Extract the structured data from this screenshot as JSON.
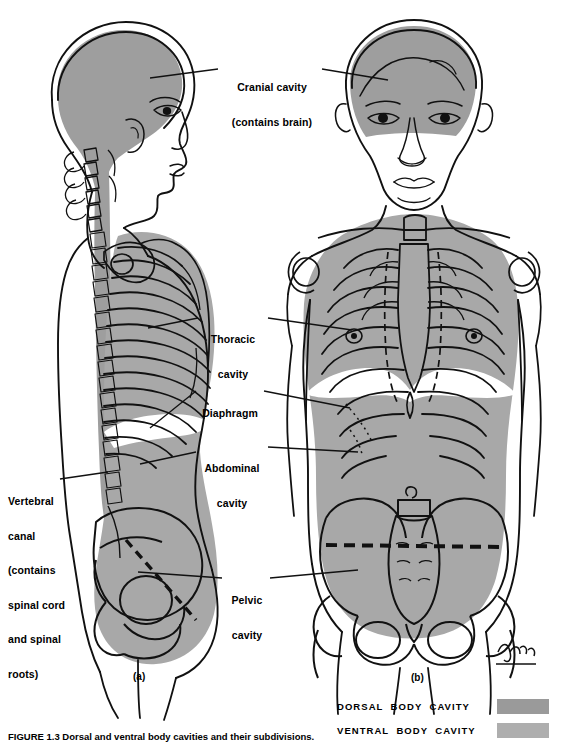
{
  "figure": {
    "caption": "FIGURE 1.3  Dorsal and ventral body cavities and their subdivisions.",
    "panel_a_label": "(a)",
    "panel_b_label": "(b)",
    "artist_signature": "Adam"
  },
  "colors": {
    "dorsal_cavity_fill": "#9e9e9e",
    "ventral_cavity_fill": "#a8a8a8",
    "outline": "#000000",
    "background": "#ffffff",
    "diaphragm_band": "#ffffff"
  },
  "labels": [
    {
      "id": "cranial-cavity",
      "line1": "Cranial cavity",
      "line2": "(contains brain)"
    },
    {
      "id": "thoracic-cavity",
      "line1": "Thoracic",
      "line2": "cavity"
    },
    {
      "id": "diaphragm",
      "line1": "Diaphragm",
      "line2": ""
    },
    {
      "id": "abdominal-cavity",
      "line1": "Abdominal",
      "line2": "cavity"
    },
    {
      "id": "pelvic-cavity",
      "line1": "Pelvic",
      "line2": "cavity"
    }
  ],
  "vertebral_label": {
    "line1": "Vertebral",
    "line2": "canal",
    "line3": "(contains",
    "line4": "spinal cord",
    "line5": "and spinal",
    "line6": "roots)"
  },
  "legend": {
    "rows": [
      {
        "label": "DORSAL  BODY  CAVITY",
        "swatch": "#9a9a9a"
      },
      {
        "label": "VENTRAL  BODY  CAVITY",
        "swatch": "#aeaeae"
      }
    ]
  }
}
